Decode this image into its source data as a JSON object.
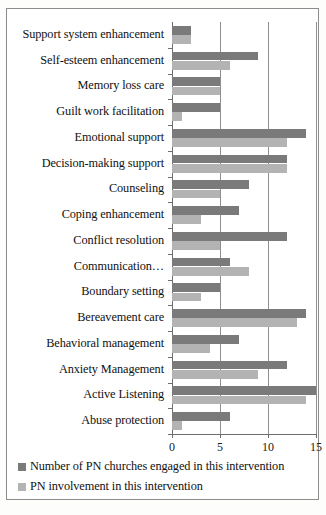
{
  "chart_data": {
    "type": "bar",
    "orientation": "horizontal",
    "title": "",
    "xlabel": "",
    "ylabel": "",
    "xlim": [
      0,
      15
    ],
    "xticks": [
      0,
      5,
      10,
      15
    ],
    "xticklabels": [
      "0",
      "5",
      "10",
      "15"
    ],
    "grid": true,
    "grid_axis": "x",
    "legend_position": "below-left",
    "categories": [
      "Support system enhancement",
      "Self-esteem enhancement",
      "Memory loss care",
      "Guilt work facilitation",
      "Emotional support",
      "Decision-making support",
      "Counseling",
      "Coping enhancement",
      "Conflict resolution",
      "Communication…",
      "Boundary setting",
      "Bereavement care",
      "Behavioral management",
      "Anxiety Management",
      "Active Listening",
      "Abuse protection"
    ],
    "series": [
      {
        "name": "Number of PN churches engaged in this intervention",
        "color": "#7a7a7a",
        "values": [
          2,
          9,
          5,
          5,
          14,
          12,
          8,
          7,
          12,
          6,
          5,
          14,
          7,
          12,
          15,
          6
        ]
      },
      {
        "name": "PN involvement in this intervention",
        "color": "#b3b3b3",
        "values": [
          2,
          6,
          5,
          1,
          12,
          12,
          5,
          3,
          5,
          8,
          3,
          13,
          4,
          9,
          14,
          1
        ]
      }
    ]
  },
  "legend": {
    "items": [
      {
        "label": "Number of PN churches engaged in this intervention",
        "color": "#7a7a7a"
      },
      {
        "label": "PN involvement in this intervention",
        "color": "#b3b3b3"
      }
    ]
  },
  "colors": {
    "series_dark": "#7a7a7a",
    "series_light": "#b3b3b3",
    "axis": "#6e6e6e",
    "grid": "#8f8f8f",
    "frame": "#8c8c8c",
    "text": "#111111",
    "background": "#ffffff"
  }
}
